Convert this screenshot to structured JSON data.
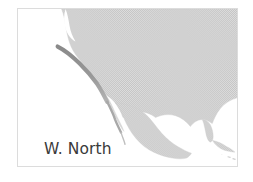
{
  "figure": {
    "kind": "locator-map",
    "width": 253,
    "height": 182,
    "background_color": "#ffffff"
  },
  "frame": {
    "border_color": "#dcdcdc",
    "fill_color": "#ffffff"
  },
  "map": {
    "title": "W. North America",
    "subject": "North America",
    "projection_note": "",
    "land_color": "#cfcfcf",
    "land_texture": "halftone-dither",
    "ocean_color": "#ffffff",
    "highlight_color": "#8f8f8f",
    "coast_line_color": "#bdbdbd",
    "highlight_region": "Pacific coast of western North America",
    "features": [
      "Pacific Ocean",
      "Atlantic Ocean",
      "Gulf of Mexico",
      "Caribbean Sea",
      "Baja California",
      "Florida",
      "Cuba"
    ]
  },
  "label": {
    "line1": "W. North",
    "line2": "America",
    "text_color": "#3a3a3a"
  }
}
